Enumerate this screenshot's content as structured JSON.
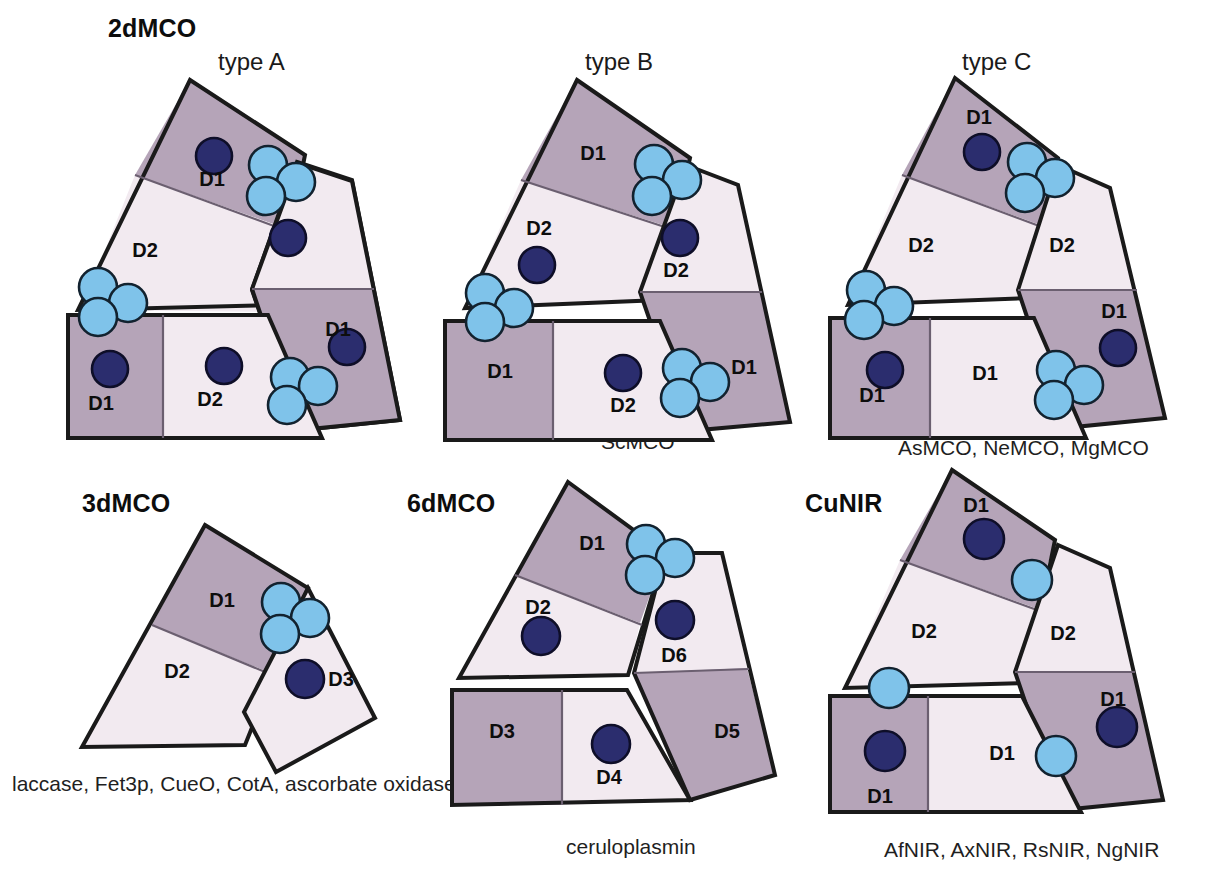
{
  "figure": {
    "colors": {
      "domain_dark": "#b5a4b8",
      "domain_light": "#f2eaf0",
      "outline": "#1a1a1a",
      "copper_type1": "#2b2d6e",
      "copper_type1_stroke": "#101030",
      "copper_type2_3": "#7fc3ea",
      "copper_type2_3_stroke": "#10202e",
      "background": "#ffffff"
    }
  },
  "groups": [
    {
      "key": "2dmco",
      "title": "2dMCO",
      "title_x": 108,
      "title_y": 14,
      "panels": [
        {
          "key": "type_a",
          "type_label": "type A",
          "type_label_x": 218,
          "type_label_y": 48,
          "caption": "",
          "caption_x": 0,
          "caption_y": 0,
          "domain_labels": [
            "D1",
            "D2",
            "D2",
            "D1",
            "D1",
            "D2"
          ]
        },
        {
          "key": "type_b",
          "type_label": "type B",
          "type_label_x": 585,
          "type_label_y": 48,
          "caption": "ScMCO",
          "caption_x": 601,
          "caption_y": 430,
          "domain_labels": [
            "D1",
            "D2",
            "D2",
            "D1",
            "D1",
            "D2"
          ]
        },
        {
          "key": "type_c",
          "type_label": "type C",
          "type_label_x": 962,
          "type_label_y": 48,
          "caption": "AsMCO, NeMCO, MgMCO",
          "caption_x": 898,
          "caption_y": 436,
          "domain_labels": [
            "D1",
            "D2",
            "D2",
            "D1",
            "D1",
            "D1"
          ]
        }
      ]
    },
    {
      "key": "3dmco",
      "title": "3dMCO",
      "title_x": 82,
      "title_y": 489,
      "panels": [
        {
          "key": "3dmco_panel",
          "type_label": "",
          "type_label_x": 0,
          "type_label_y": 0,
          "caption": "laccase, Fet3p, CueO, CotA, ascorbate oxidase",
          "caption_x": 12,
          "caption_y": 772,
          "domain_labels": [
            "D1",
            "D2",
            "D3"
          ]
        }
      ]
    },
    {
      "key": "6dmco",
      "title": "6dMCO",
      "title_x": 407,
      "title_y": 489,
      "panels": [
        {
          "key": "6dmco_panel",
          "type_label": "",
          "type_label_x": 0,
          "type_label_y": 0,
          "caption": "ceruloplasmin",
          "caption_x": 566,
          "caption_y": 835,
          "domain_labels": [
            "D1",
            "D2",
            "D3",
            "D4",
            "D5",
            "D6"
          ]
        }
      ]
    },
    {
      "key": "cunir",
      "title": "CuNIR",
      "title_x": 805,
      "title_y": 489,
      "panels": [
        {
          "key": "cunir_panel",
          "type_label": "",
          "type_label_x": 0,
          "type_label_y": 0,
          "caption": "AfNIR, AxNIR, RsNIR, NgNIR",
          "caption_x": 884,
          "caption_y": 838,
          "domain_labels": [
            "D1",
            "D2",
            "D2",
            "D1",
            "D1",
            "D1"
          ]
        }
      ]
    }
  ],
  "domain_labels": {
    "type_a": [
      {
        "text": "D1",
        "x": 212,
        "y": 186
      },
      {
        "text": "D2",
        "x": 145,
        "y": 257
      },
      {
        "text": "D1",
        "x": 335,
        "y": 336
      },
      {
        "text": "D1",
        "x": 101,
        "y": 405
      },
      {
        "text": "D2",
        "x": 207,
        "y": 401
      }
    ],
    "type_b": [
      {
        "text": "D1",
        "x": 593,
        "y": 155
      },
      {
        "text": "D2",
        "x": 539,
        "y": 235
      },
      {
        "text": "D2",
        "x": 675,
        "y": 270
      },
      {
        "text": "D1",
        "x": 741,
        "y": 369
      },
      {
        "text": "D1",
        "x": 509,
        "y": 372
      },
      {
        "text": "D2",
        "x": 624,
        "y": 407
      }
    ],
    "type_c": [
      {
        "text": "D1",
        "x": 979,
        "y": 119
      },
      {
        "text": "D2",
        "x": 923,
        "y": 246
      },
      {
        "text": "D2",
        "x": 1065,
        "y": 248
      },
      {
        "text": "D1",
        "x": 1113,
        "y": 314
      },
      {
        "text": "D1",
        "x": 874,
        "y": 397
      },
      {
        "text": "D1",
        "x": 984,
        "y": 375
      }
    ],
    "3dmco": [
      {
        "text": "D1",
        "x": 222,
        "y": 601
      },
      {
        "text": "D2",
        "x": 177,
        "y": 672
      },
      {
        "text": "D3",
        "x": 336,
        "y": 677
      }
    ],
    "6dmco": [
      {
        "text": "D1",
        "x": 589,
        "y": 544
      },
      {
        "text": "D2",
        "x": 538,
        "y": 612
      },
      {
        "text": "D6",
        "x": 672,
        "y": 654
      },
      {
        "text": "D3",
        "x": 500,
        "y": 731
      },
      {
        "text": "D4",
        "x": 609,
        "y": 775
      },
      {
        "text": "D5",
        "x": 723,
        "y": 731
      }
    ],
    "cunir": [
      {
        "text": "D1",
        "x": 974,
        "y": 507
      },
      {
        "text": "D2",
        "x": 924,
        "y": 632
      },
      {
        "text": "D2",
        "x": 1062,
        "y": 634
      },
      {
        "text": "D1",
        "x": 1112,
        "y": 702
      },
      {
        "text": "D1",
        "x": 1001,
        "y": 754
      },
      {
        "text": "D1",
        "x": 879,
        "y": 798
      }
    ]
  },
  "legend_semantics": {
    "dark_domain": "cupredoxin domain containing type 1 copper (dark shading)",
    "light_domain": "cupredoxin domain without copper (light shading)",
    "dark_circle": "type 1 copper site",
    "light_circle": "type 2 / type 3 copper site"
  }
}
